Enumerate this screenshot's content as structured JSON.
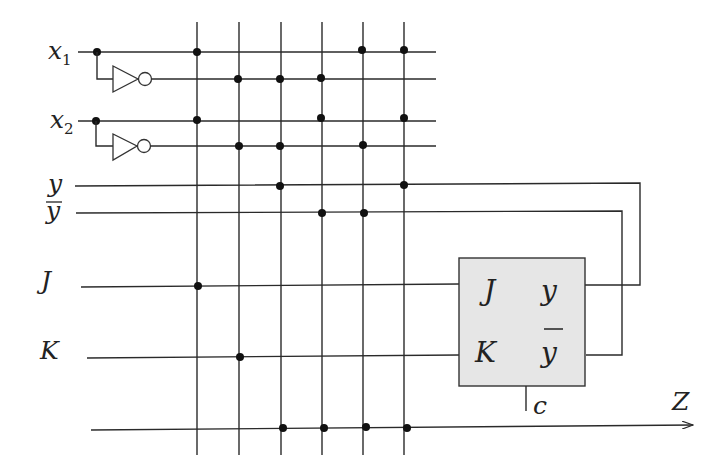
{
  "diagram": {
    "inputs": [
      {
        "id": "x1",
        "label": "x",
        "sub": "1"
      },
      {
        "id": "x2",
        "label": "x",
        "sub": "2"
      }
    ],
    "state_lines": [
      {
        "id": "y",
        "label": "y"
      },
      {
        "id": "ybar",
        "label": "y",
        "overline": true
      }
    ],
    "control_lines": [
      {
        "id": "J",
        "label": "J"
      },
      {
        "id": "K",
        "label": "K"
      }
    ],
    "output": {
      "id": "Z",
      "label": "Z"
    },
    "flipflop": {
      "inputs": [
        "J",
        "K"
      ],
      "outputs": [
        "y",
        "y"
      ],
      "outputs_overline": [
        false,
        true
      ],
      "clock_label": "c",
      "fill_color": "#e6e6e6"
    },
    "row_labels": {
      "x1": "x",
      "x1_sub": "1",
      "x2": "x",
      "x2_sub": "2",
      "y": "y",
      "ybar": "y",
      "J": "J",
      "K": "K",
      "Z": "Z"
    },
    "box_labels": {
      "J": "J",
      "K": "K",
      "y": "y",
      "ybar": "y",
      "c": "c"
    },
    "vertical_lines": 6,
    "connection_matrix": {
      "rows": [
        "x1",
        "not_x1",
        "x2",
        "not_x2",
        "y",
        "not_y",
        "J",
        "K",
        "Z"
      ],
      "dots": {
        "x1": [
          1,
          5,
          6
        ],
        "not_x1": [
          2,
          3,
          4
        ],
        "x2": [
          1,
          4,
          6
        ],
        "not_x2": [
          2,
          3,
          5
        ],
        "y": [
          3,
          6
        ],
        "not_y": [
          4,
          5
        ],
        "J": [
          1
        ],
        "K": [
          2
        ],
        "Z": [
          3,
          4,
          5,
          6
        ]
      }
    }
  }
}
